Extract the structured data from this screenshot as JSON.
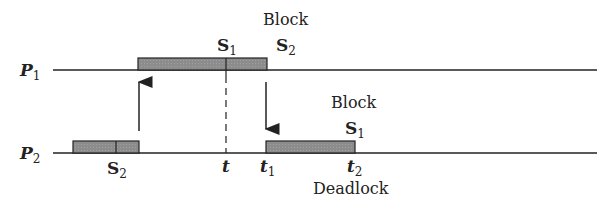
{
  "diagram": {
    "processes": [
      {
        "id": "P1",
        "label": "P",
        "sub": "1"
      },
      {
        "id": "P2",
        "label": "P",
        "sub": "2"
      }
    ],
    "semaphore_labels": {
      "p1_s1": {
        "label": "S",
        "sub": "1"
      },
      "p1_s2": {
        "label": "S",
        "sub": "2"
      },
      "p2_s2": {
        "label": "S",
        "sub": "2"
      },
      "p2_s1": {
        "label": "S",
        "sub": "1"
      }
    },
    "block_label_top": "Block",
    "block_label_bottom": "Block",
    "time_labels": {
      "t": {
        "label": "t",
        "sub": ""
      },
      "t1": {
        "label": "t",
        "sub": "1"
      },
      "t2": {
        "label": "t",
        "sub": "2"
      }
    },
    "deadlock_label": "Deadlock",
    "colors": {
      "bar_fill": "#8c8c8c",
      "line": "#222222"
    }
  }
}
